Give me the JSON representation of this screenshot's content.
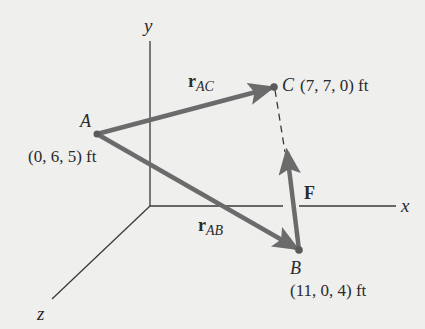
{
  "diagram": {
    "type": "3d-force-vector",
    "colors": {
      "background": "#efefee",
      "axis": "#3a3a3a",
      "vector": "#6b6b6b",
      "text": "#2a2a2a"
    },
    "axes": {
      "x": {
        "label": "x"
      },
      "y": {
        "label": "y"
      },
      "z": {
        "label": "z"
      }
    },
    "points": {
      "A": {
        "name": "A",
        "coords": "(0, 6, 5) ft"
      },
      "B": {
        "name": "B",
        "coords": "(11, 0, 4) ft"
      },
      "C": {
        "name": "C",
        "coords": "(7, 7, 0) ft"
      }
    },
    "vectors": {
      "rAC": {
        "symbol": "r",
        "subscript": "AC"
      },
      "rAB": {
        "symbol": "r",
        "subscript": "AB"
      },
      "F": {
        "symbol": "F"
      }
    }
  }
}
